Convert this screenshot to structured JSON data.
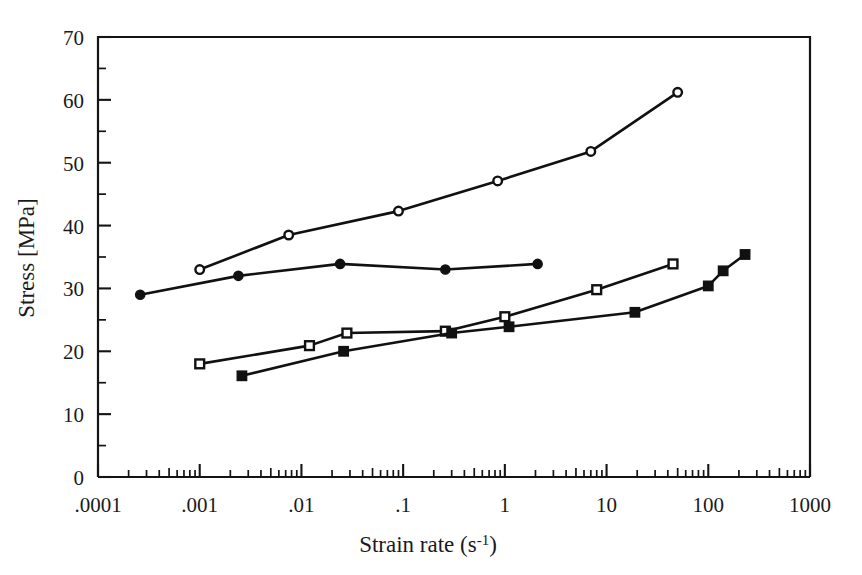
{
  "chart_data": {
    "type": "line",
    "title": "",
    "xlabel": "Strain rate  (s-1)",
    "xlabel_base": "Strain rate  (s",
    "xlabel_sup": "-1",
    "xlabel_tail": ")",
    "ylabel": "Stress [MPa]",
    "xscale": "log",
    "xlim": [
      0.0001,
      1000
    ],
    "ylim": [
      0,
      70
    ],
    "grid": false,
    "legend": "none",
    "x_tick_labels": [
      ".0001",
      ".001",
      ".01",
      ".1",
      "1",
      "10",
      "100",
      "1000"
    ],
    "x_tick_values": [
      0.0001,
      0.001,
      0.01,
      0.1,
      1,
      10,
      100,
      1000
    ],
    "y_tick_labels": [
      "0",
      "10",
      "20",
      "30",
      "40",
      "50",
      "60",
      "70"
    ],
    "y_tick_values": [
      0,
      10,
      20,
      30,
      40,
      50,
      60,
      70
    ],
    "y_minor_values": [
      5,
      15,
      25,
      35,
      45,
      55,
      65
    ],
    "series": [
      {
        "name": "Series A (open circles)",
        "marker": "open-circle",
        "x": [
          0.001,
          0.0075,
          0.09,
          0.85,
          7.0,
          50.0
        ],
        "y": [
          33.0,
          38.5,
          42.3,
          47.1,
          51.8,
          61.2
        ]
      },
      {
        "name": "Series B (filled circles)",
        "marker": "filled-circle",
        "x": [
          0.00026,
          0.0024,
          0.024,
          0.26,
          2.1
        ],
        "y": [
          29.0,
          32.0,
          33.9,
          33.0,
          33.9
        ]
      },
      {
        "name": "Series C (open squares)",
        "marker": "open-square",
        "x": [
          0.001,
          0.012,
          0.028,
          0.26,
          1.0,
          8.0,
          45.0
        ],
        "y": [
          18.0,
          20.9,
          22.9,
          23.2,
          25.5,
          29.8,
          33.9
        ]
      },
      {
        "name": "Series D (filled squares)",
        "marker": "filled-square",
        "x": [
          0.0026,
          0.026,
          0.3,
          1.1,
          19.0,
          100.0,
          140.0,
          230.0
        ],
        "y": [
          16.1,
          20.0,
          22.9,
          23.9,
          26.2,
          30.4,
          32.8,
          35.4
        ]
      }
    ]
  },
  "axes": {
    "x_title_display": "Strain rate  (s-1)",
    "y_title_display": "Stress [MPa]"
  }
}
